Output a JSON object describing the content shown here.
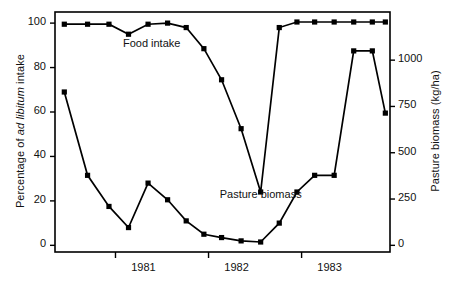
{
  "chart_data": {
    "type": "line",
    "title": "",
    "xlabel": "",
    "ylabel": "Percentage of ad libitum intake",
    "ylabel_plain_prefix": "Percentage of ",
    "ylabel_italic": "ad libitum",
    "ylabel_plain_suffix": " intake",
    "y2label": "Pasture biomass (kg/ha)",
    "x_tick_labels": [
      "1981",
      "1982",
      "1983"
    ],
    "x_tick_positions": [
      1981.0,
      1982.0,
      1983.0
    ],
    "xlim": [
      1980.35,
      1983.95
    ],
    "y_tick_labels": [
      "0",
      "20",
      "40",
      "60",
      "80",
      "100"
    ],
    "y_tick_values": [
      0,
      20,
      40,
      60,
      80,
      100
    ],
    "ylim": [
      -3,
      105
    ],
    "y2_tick_labels": [
      "0",
      "250",
      "500",
      "750",
      "1000"
    ],
    "y2_tick_values": [
      0,
      250,
      500,
      750,
      1000
    ],
    "y2lim": [
      -36,
      1260
    ],
    "grid": false,
    "legend_position": "in-plot annotations",
    "marker": "square",
    "line_color": "#000000",
    "frame_color": "#000000",
    "background": "#ffffff",
    "series": [
      {
        "name": "Food intake",
        "axis": "left",
        "units": "Percentage of ad libitum intake",
        "label_position": {
          "x": 1981.02,
          "y": 90
        },
        "x": [
          1980.45,
          1980.7,
          1980.93,
          1981.14,
          1981.35,
          1981.56,
          1981.76,
          1981.95,
          1982.14,
          1982.35,
          1982.56,
          1982.76,
          1982.95,
          1983.14,
          1983.35,
          1983.56,
          1983.76,
          1983.9
        ],
        "values": [
          99.5,
          99.5,
          99.5,
          95.0,
          99.5,
          100.0,
          98.0,
          88.5,
          74.5,
          52.5,
          24.0,
          98.0,
          100.5,
          100.5,
          100.5,
          100.5,
          100.5,
          100.5
        ]
      },
      {
        "name": "Pasture biomass",
        "axis": "right",
        "units": "kg/ha",
        "label_position": {
          "x": 1982.02,
          "y": 22
        },
        "x": [
          1980.45,
          1980.7,
          1980.93,
          1981.14,
          1981.35,
          1981.56,
          1981.76,
          1981.95,
          1982.14,
          1982.35,
          1982.56,
          1982.76,
          1982.95,
          1983.14,
          1983.35,
          1983.56,
          1983.76,
          1983.9
        ],
        "values_left_scale": [
          69.0,
          31.5,
          17.5,
          8.0,
          28.0,
          20.5,
          11.0,
          5.0,
          3.5,
          2.0,
          1.5,
          10.0,
          24.0,
          31.5,
          31.5,
          87.5,
          87.5,
          59.5
        ],
        "values": [
          830,
          380,
          210,
          95,
          335,
          245,
          130,
          60,
          40,
          25,
          18,
          120,
          290,
          380,
          380,
          1050,
          1050,
          715
        ]
      }
    ],
    "annotations": [
      {
        "text": "Food intake",
        "x": 1981.08,
        "y": 90
      },
      {
        "text": "Pasture biomass",
        "x": 1982.12,
        "y": 22
      }
    ]
  },
  "figure": {
    "axis_left_title": "Percentage of ad libitum intake",
    "axis_right_title": "Pasture biomass (kg/ha)"
  }
}
